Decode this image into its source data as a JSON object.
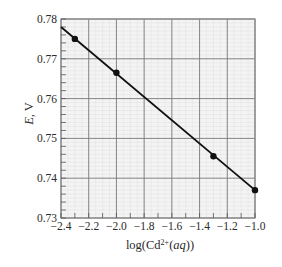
{
  "chart_data": {
    "type": "line",
    "title": "",
    "xlabel": "log(Cd2+(aq))",
    "xlabel_parts": {
      "prefix": "log(Cd",
      "superscript": "2+",
      "open": "(",
      "italic": "aq",
      "suffix": "))"
    },
    "ylabel": "E, V",
    "ylabel_parts": {
      "italic": "E",
      "suffix": ", V"
    },
    "xlim": [
      -2.4,
      -1.0
    ],
    "ylim": [
      0.73,
      0.78
    ],
    "x_ticks": [
      -2.4,
      -2.2,
      -2.0,
      -1.8,
      -1.6,
      -1.4,
      -1.2,
      -1.0
    ],
    "x_tick_labels": [
      "−2.4",
      "−2.2",
      "−2.0",
      "−1.8",
      "−1.6",
      "−1.4",
      "−1.2",
      "−1.0"
    ],
    "y_ticks": [
      0.73,
      0.74,
      0.75,
      0.76,
      0.77,
      0.78
    ],
    "y_tick_labels": [
      "0.73",
      "0.74",
      "0.75",
      "0.76",
      "0.77",
      "0.78"
    ],
    "x_minor_step": 0.1,
    "y_minor_step": 0.002,
    "grid": true,
    "legend": null,
    "series": [
      {
        "name": "E vs log[Cd2+]",
        "points": [
          {
            "x": -2.3,
            "y": 0.775
          },
          {
            "x": -2.0,
            "y": 0.7665
          },
          {
            "x": -1.3,
            "y": 0.7455
          },
          {
            "x": -1.0,
            "y": 0.737
          }
        ],
        "fit_line": {
          "x_start": -2.4,
          "y_start": 0.778,
          "x_end": -1.0,
          "y_end": 0.737
        }
      }
    ],
    "colors": {
      "line": "#111111",
      "marker": "#111111",
      "grid_major": "#7a7a7a",
      "grid_minor": "#e2e2e2",
      "plot_bg": "#f4f4f4",
      "frame": "#8a8a8a"
    }
  }
}
